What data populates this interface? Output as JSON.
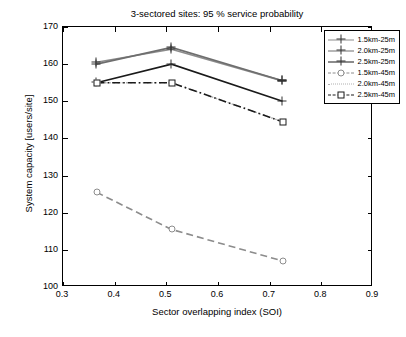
{
  "chart_data": {
    "type": "line",
    "title": "3-sectored sites: 95 % service probability",
    "xlabel": "Sector overlapping index (SOI)",
    "ylabel": "System capacity [users/site]",
    "xlim": [
      0.3,
      0.9
    ],
    "ylim": [
      100,
      170
    ],
    "xticks": [
      "0.3",
      "0.4",
      "0.5",
      "0.6",
      "0.7",
      "0.8",
      "0.9"
    ],
    "yticks": [
      "100",
      "110",
      "120",
      "130",
      "140",
      "150",
      "160",
      "170"
    ],
    "grid": false,
    "legend_position": "top-right",
    "series": [
      {
        "name": "1.5km-25m",
        "color": "#8c8c8c",
        "style": "solid",
        "marker": "plus",
        "x": [
          0.365,
          0.51,
          0.725
        ],
        "y": [
          160.5,
          164.0,
          155.5
        ]
      },
      {
        "name": "2.0km-25m",
        "color": "#6e6e6e",
        "style": "solid",
        "marker": "plus",
        "x": [
          0.365,
          0.51,
          0.725
        ],
        "y": [
          160.0,
          164.5,
          155.5
        ]
      },
      {
        "name": "2.5km-25m",
        "color": "#1a1a1a",
        "style": "solid",
        "marker": "plus",
        "x": [
          0.365,
          0.51,
          0.725
        ],
        "y": [
          155.0,
          160.0,
          150.0
        ]
      },
      {
        "name": "1.5km-45m",
        "color": "#8c8c8c",
        "style": "dashed",
        "marker": "circle",
        "x": [
          0.365,
          0.51,
          0.725
        ],
        "y": [
          125.5,
          115.5,
          107.0
        ]
      },
      {
        "name": "2.0km-45m",
        "color": "#b0b0b0",
        "style": "dotted",
        "marker": "none",
        "x": [
          0.365,
          0.51,
          0.725
        ],
        "y": [
          155.0,
          155.0,
          144.5
        ]
      },
      {
        "name": "2.5km-45m",
        "color": "#1a1a1a",
        "style": "dashdot",
        "marker": "square",
        "x": [
          0.365,
          0.51,
          0.725
        ],
        "y": [
          155.0,
          155.0,
          144.5
        ]
      }
    ]
  }
}
